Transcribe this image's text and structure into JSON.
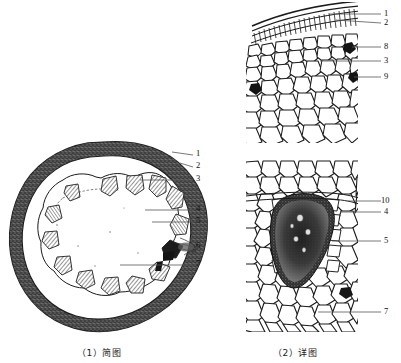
{
  "figure": {
    "type": "botanical-transverse-section-illustration",
    "panels": [
      {
        "id": "schematic",
        "caption": "（1）简图",
        "description": "schematic transverse section showing outer ring and circle of vascular bundles",
        "callouts": [
          {
            "num": "1",
            "x": 196,
            "y": 153
          },
          {
            "num": "2",
            "x": 196,
            "y": 165
          },
          {
            "num": "3",
            "x": 196,
            "y": 178
          },
          {
            "num": "4",
            "x": 196,
            "y": 208
          },
          {
            "num": "5",
            "x": 196,
            "y": 220
          },
          {
            "num": "6",
            "x": 196,
            "y": 245
          },
          {
            "num": "7",
            "x": 196,
            "y": 263
          }
        ]
      },
      {
        "id": "detail-upper",
        "caption": "",
        "description": "detailed cellular tissue showing epidermis, cortex and dark inclusions",
        "callouts": [
          {
            "num": "1",
            "x": 384,
            "y": 12
          },
          {
            "num": "2",
            "x": 384,
            "y": 21
          },
          {
            "num": "8",
            "x": 384,
            "y": 45
          },
          {
            "num": "3",
            "x": 384,
            "y": 59
          },
          {
            "num": "9",
            "x": 384,
            "y": 75
          }
        ]
      },
      {
        "id": "detail-lower",
        "caption": "（2）详图",
        "description": "detailed vascular bundle surrounded by parenchyma cells",
        "callouts": [
          {
            "num": "10",
            "x": 384,
            "y": 199
          },
          {
            "num": "4",
            "x": 384,
            "y": 210
          },
          {
            "num": "5",
            "x": 384,
            "y": 239
          },
          {
            "num": "7",
            "x": 384,
            "y": 310
          }
        ]
      }
    ],
    "captions": {
      "left": "（1）简图",
      "right": "（2）详图"
    },
    "colors": {
      "ink": "#1a1a1a",
      "paper": "#ffffff",
      "leader": "#555555",
      "bundle_fill": "#6b6b6b",
      "dense_core": "#2a2a2a"
    },
    "counts": {
      "vascular_bundles_schematic": 14
    }
  }
}
